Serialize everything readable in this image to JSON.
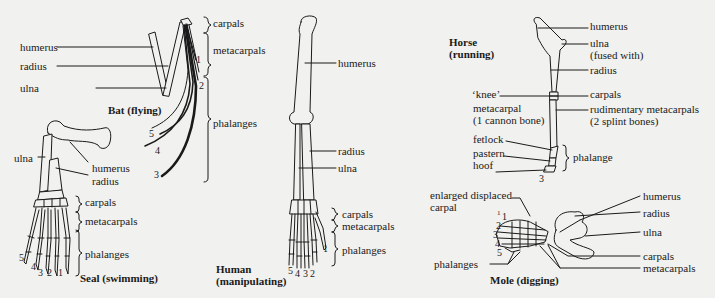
{
  "figure": {
    "panels": {
      "bat": {
        "title": "Bat (flying)",
        "labels": {
          "humerus": "humerus",
          "radius": "radius",
          "ulna": "ulna",
          "carpals": "carpals",
          "metacarpals": "metacarpals",
          "phalanges": "phalanges"
        },
        "digits": [
          "1",
          "2",
          "3",
          "4",
          "5"
        ]
      },
      "seal": {
        "title": "Seal (swimming)",
        "labels": {
          "ulna": "ulna",
          "humerus": "humerus",
          "radius": "radius",
          "carpals": "carpals",
          "metacarpals": "metacarpals",
          "phalanges": "phalanges"
        },
        "digits": [
          "5",
          "4",
          "3",
          "2",
          "1"
        ]
      },
      "human": {
        "title_line1": "Human",
        "title_line2": "(manipulating)",
        "labels": {
          "humerus": "humerus",
          "radius": "radius",
          "ulna": "ulna",
          "carpals": "carpals",
          "metacarpals": "metacarpals",
          "phalanges": "phalanges"
        },
        "digits": [
          "5",
          "4",
          "3",
          "2",
          "1"
        ]
      },
      "horse": {
        "title_line1": "Horse",
        "title_line2": "(running)",
        "labels": {
          "humerus": "humerus",
          "ulna": "ulna",
          "fused_with": "(fused with)",
          "radius": "radius",
          "knee": "‘knee’",
          "carpals": "carpals",
          "metacarpal": "metacarpal",
          "cannon_bone": "(1 cannon bone)",
          "rudimentary": "rudimentary metacarpals",
          "splint": "(2 splint bones)",
          "fetlock": "fetlock",
          "pastern": "pastern",
          "hoof": "hoof",
          "phalange": "phalange"
        },
        "digits": [
          "3"
        ]
      },
      "mole": {
        "title": "Mole (digging)",
        "labels": {
          "enlarged_line1": "enlarged displaced",
          "enlarged_line2": "carpal",
          "phalanges": "phalanges",
          "humerus": "humerus",
          "radius": "radius",
          "ulna": "ulna",
          "carpals": "carpals",
          "metacarpals": "metacarpals"
        },
        "digits": [
          "1",
          "1",
          "2",
          "3",
          "4",
          "5"
        ]
      }
    }
  }
}
